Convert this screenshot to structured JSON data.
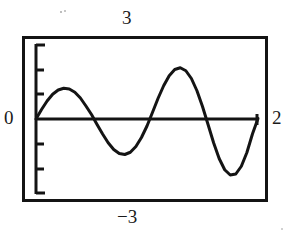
{
  "window": {
    "kind": "graphing-calculator-plot-window",
    "background": "#ffffff",
    "ink": "#141414"
  },
  "labels": {
    "y_max": "3",
    "y_min": "−3",
    "x_min": "0",
    "x_max": "2"
  },
  "chart_data": {
    "type": "line",
    "title": "",
    "subtitle": "",
    "xlabel": "",
    "ylabel": "",
    "xlim": [
      0,
      2
    ],
    "ylim": [
      -3,
      3
    ],
    "x_tick_labels": [
      "0",
      "2"
    ],
    "y_tick_labels": [
      "3",
      "−3"
    ],
    "grid": false,
    "legend": null,
    "axis_line_y": 0,
    "y_axis_tick_count": 6,
    "y_tick_step": 1,
    "series": [
      {
        "name": "curve",
        "style": "solid-black-pixelated",
        "color": "#141414",
        "x": [
          0.0,
          0.05,
          0.1,
          0.15,
          0.2,
          0.25,
          0.3,
          0.35,
          0.4,
          0.45,
          0.5,
          0.55,
          0.6,
          0.65,
          0.7,
          0.75,
          0.8,
          0.85,
          0.9,
          0.95,
          1.0,
          1.05,
          1.1,
          1.15,
          1.2,
          1.25,
          1.3,
          1.35,
          1.4,
          1.45,
          1.5,
          1.55,
          1.6,
          1.65,
          1.7,
          1.75,
          1.8,
          1.85,
          1.9,
          1.95,
          2.0
        ],
        "y": [
          0.0,
          0.38,
          0.72,
          0.99,
          1.16,
          1.23,
          1.2,
          1.07,
          0.84,
          0.52,
          0.18,
          -0.22,
          -0.6,
          -0.95,
          -1.22,
          -1.38,
          -1.42,
          -1.33,
          -1.1,
          -0.74,
          -0.28,
          0.27,
          0.83,
          1.33,
          1.73,
          1.98,
          2.05,
          1.93,
          1.62,
          1.13,
          0.5,
          -0.22,
          -0.95,
          -1.58,
          -2.03,
          -2.24,
          -2.2,
          -1.89,
          -1.34,
          -0.6,
          0.02
        ]
      }
    ],
    "features": {
      "zero_crossings_x": [
        0.0,
        0.55,
        1.03,
        1.53,
        1.97
      ],
      "local_maxima": [
        {
          "x": 0.25,
          "y": 1.23
        },
        {
          "x": 1.27,
          "y": 2.06
        }
      ],
      "local_minima": [
        {
          "x": 0.8,
          "y": -1.42
        },
        {
          "x": 1.76,
          "y": -2.25
        }
      ],
      "amplitude_trend": "increasing"
    }
  }
}
